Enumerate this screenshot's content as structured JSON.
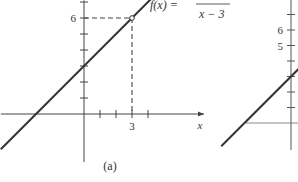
{
  "chart_data": [
    {
      "type": "line",
      "panel_label": "(a)",
      "function_label": "f(x) =",
      "function_denominator": "x − 3",
      "xlabel": "x",
      "ylabel": "",
      "xlim": [
        -5.2,
        7.5
      ],
      "ylim": [
        -3.0,
        7.1
      ],
      "x_ticks": [
        1,
        2,
        3,
        4
      ],
      "x_tick_labels": [
        {
          "value": 3,
          "label": "3"
        }
      ],
      "y_ticks": [
        1,
        2,
        3,
        4,
        5,
        6,
        7
      ],
      "y_tick_labels": [
        {
          "value": 6,
          "label": "6"
        }
      ],
      "series": [
        {
          "name": "f(x)",
          "slope": 1,
          "intercept": 3,
          "x_range": [
            -5.2,
            4.2
          ]
        }
      ],
      "hole": {
        "x": 3,
        "y": 6
      },
      "guides": [
        {
          "from": [
            0,
            6
          ],
          "to": [
            3,
            6
          ],
          "style": "dashed"
        },
        {
          "from": [
            3,
            6
          ],
          "to": [
            3,
            0
          ],
          "style": "dashed"
        }
      ]
    },
    {
      "type": "line",
      "panel_label": "",
      "y_tick_labels": [
        {
          "value": 6,
          "label": "6"
        },
        {
          "value": 5,
          "label": "5"
        }
      ],
      "y_ticks": [
        1,
        2,
        3,
        4,
        5,
        6,
        7
      ],
      "series": [
        {
          "name": "g(x)",
          "slope": 1,
          "intercept": 3,
          "x_range": [
            -4.5,
            0.6
          ]
        }
      ]
    }
  ]
}
